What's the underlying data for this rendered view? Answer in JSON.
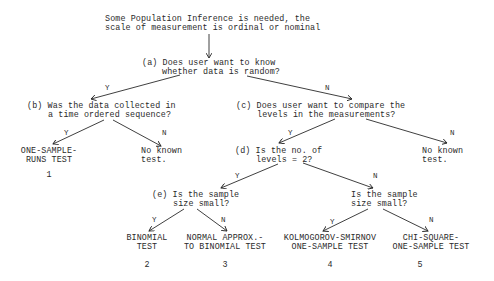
{
  "root": {
    "line1": "Some Population Inference is needed, the",
    "line2": "scale of measurement is ordinal or nominal"
  },
  "nodes": {
    "a": {
      "line1": "(a) Does user want to know",
      "line2": "whether data is random?"
    },
    "b": {
      "line1": "(b) Was the data collected in",
      "line2": "a time ordered sequence?"
    },
    "c": {
      "line1": "(c) Does user want to compare the",
      "line2": "levels in the measurements?"
    },
    "d": {
      "line1": "(d) Is the no. of",
      "line2": "levels = 2?"
    },
    "e": {
      "line1": "(e) Is the sample",
      "line2": "size small?"
    },
    "f": {
      "line1": "Is the sample",
      "line2": "size small?"
    }
  },
  "edge_labels": {
    "yes": "Y",
    "no": "N"
  },
  "leaves": {
    "runs": {
      "line1": "ONE-SAMPLE-",
      "line2": "RUNS TEST",
      "number": "1"
    },
    "none_b": {
      "line1": "No known",
      "line2": "test."
    },
    "none_c": {
      "line1": "No known",
      "line2": "test."
    },
    "binomial": {
      "line1": "BINOMIAL",
      "line2": "TEST",
      "number": "2"
    },
    "normal": {
      "line1": "NORMAL APPROX.-",
      "line2": "TO BINOMIAL TEST",
      "number": "3"
    },
    "ks": {
      "line1": "KOLMOGOROV-SMIRNOV",
      "line2": "ONE-SAMPLE TEST",
      "number": "4"
    },
    "chisq": {
      "line1": "CHI-SQUARE-",
      "line2": "ONE-SAMPLE TEST",
      "number": "5"
    }
  },
  "colors": {
    "ink": "#2a2a2a",
    "background": "#ffffff"
  }
}
